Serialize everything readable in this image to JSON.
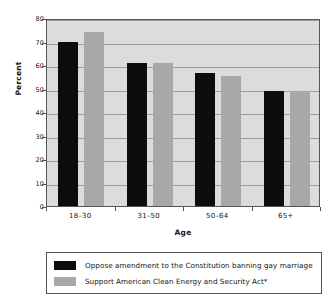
{
  "chart_data": {
    "type": "bar",
    "title": "",
    "xlabel": "Age",
    "ylabel": "Percent",
    "categories": [
      "18–30",
      "31–50",
      "50–64",
      "65+"
    ],
    "series": [
      {
        "name": "Oppose amendment to the Constitution banning gay marriage",
        "color": "#0d0d0d",
        "values": [
          70,
          61,
          56.5,
          49
        ]
      },
      {
        "name": "Support American Clean Energy and Security Act*",
        "color": "#a8a8a8",
        "values": [
          74,
          61,
          55.5,
          49
        ]
      }
    ],
    "ylim": [
      0,
      80
    ],
    "yticks": [
      0,
      10,
      20,
      30,
      40,
      50,
      60,
      70,
      80
    ],
    "ytick_labels": [
      "0",
      "10",
      "20",
      "30",
      "40",
      "50",
      "60",
      "70",
      "80"
    ],
    "grid": true,
    "legend_position": "bottom",
    "plot_background": "#dcdcdc",
    "axis_color": "#555555",
    "gridline_color": "#9d9d9d"
  },
  "legend": {
    "entries": [
      {
        "label": "Oppose amendment to the Constitution banning gay marriage"
      },
      {
        "label": "Support American Clean Energy and Security Act*"
      }
    ]
  }
}
